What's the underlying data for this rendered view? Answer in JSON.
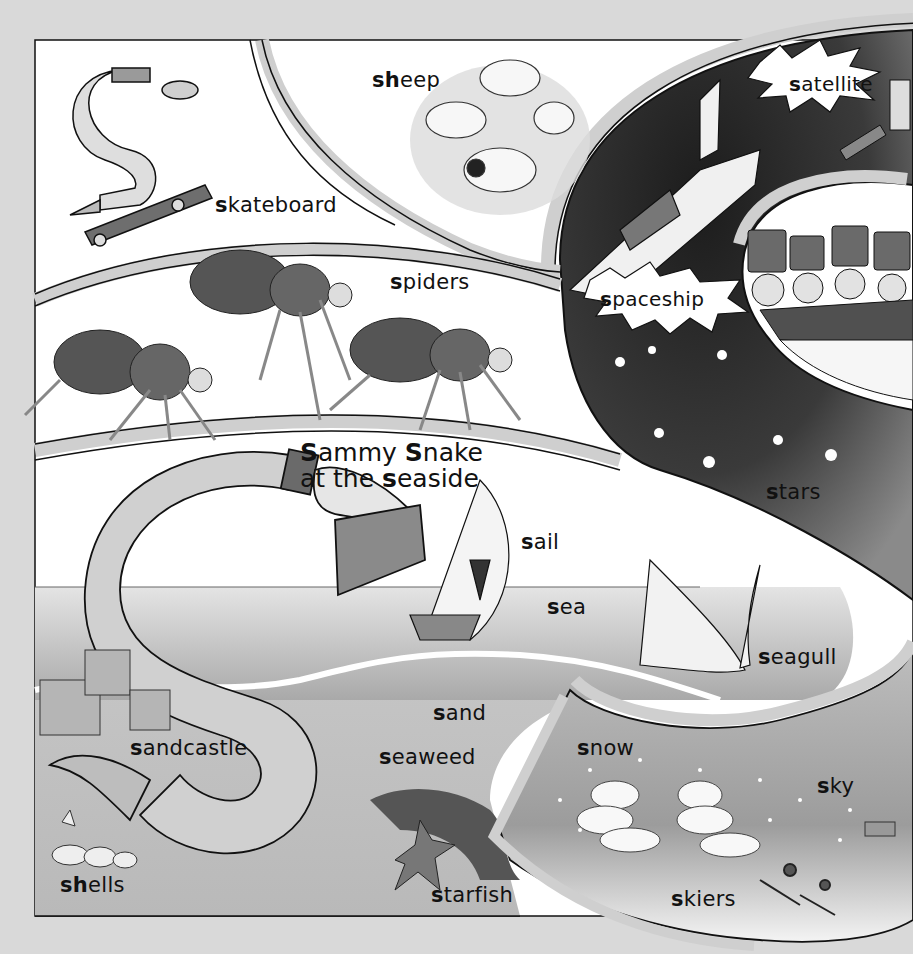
{
  "page": {
    "letter": "S",
    "background": "#d9d9d9",
    "title": {
      "line1": [
        {
          "text": "S",
          "bold": true
        },
        {
          "text": "ammy ",
          "bold": false
        },
        {
          "text": "S",
          "bold": true
        },
        {
          "text": "nake",
          "bold": false
        }
      ],
      "line2": [
        {
          "text": "at the ",
          "bold": false
        },
        {
          "text": "s",
          "bold": true
        },
        {
          "text": "easide",
          "bold": false
        }
      ]
    }
  },
  "labels": [
    {
      "id": "sheep",
      "bold": "sh",
      "rest": "eep",
      "x": 372,
      "y": 68
    },
    {
      "id": "satellite",
      "bold": "s",
      "rest": "atellite",
      "x": 789,
      "y": 72
    },
    {
      "id": "skateboard",
      "bold": "s",
      "rest": "kateboard",
      "x": 215,
      "y": 193
    },
    {
      "id": "spiders",
      "bold": "s",
      "rest": "piders",
      "x": 390,
      "y": 270
    },
    {
      "id": "spaceship",
      "bold": "s",
      "rest": "paceship",
      "x": 600,
      "y": 287
    },
    {
      "id": "stars",
      "bold": "s",
      "rest": "tars",
      "x": 766,
      "y": 480
    },
    {
      "id": "sail",
      "bold": "s",
      "rest": "ail",
      "x": 521,
      "y": 530
    },
    {
      "id": "sea",
      "bold": "s",
      "rest": "ea",
      "x": 547,
      "y": 595
    },
    {
      "id": "seagull",
      "bold": "s",
      "rest": "eagull",
      "x": 758,
      "y": 645
    },
    {
      "id": "sand",
      "bold": "s",
      "rest": "and",
      "x": 433,
      "y": 701
    },
    {
      "id": "sandcastle",
      "bold": "s",
      "rest": "andcastle",
      "x": 130,
      "y": 736
    },
    {
      "id": "snow",
      "bold": "s",
      "rest": "now",
      "x": 577,
      "y": 736
    },
    {
      "id": "seaweed",
      "bold": "s",
      "rest": "eaweed",
      "x": 379,
      "y": 745
    },
    {
      "id": "sky",
      "bold": "s",
      "rest": "ky",
      "x": 817,
      "y": 774
    },
    {
      "id": "shells",
      "bold": "sh",
      "rest": "ells",
      "x": 60,
      "y": 873
    },
    {
      "id": "starfish",
      "bold": "s",
      "rest": "tarfish",
      "x": 431,
      "y": 883
    },
    {
      "id": "skiers",
      "bold": "s",
      "rest": "kiers",
      "x": 671,
      "y": 887
    }
  ],
  "colors": {
    "ink": "#111111",
    "panel": "#ffffff",
    "band": "#d4d4d4",
    "space": "#2a2a2a",
    "sea": "#bdbdbd",
    "sand": "#c8c8c8",
    "snake": "#cfcfcf"
  }
}
